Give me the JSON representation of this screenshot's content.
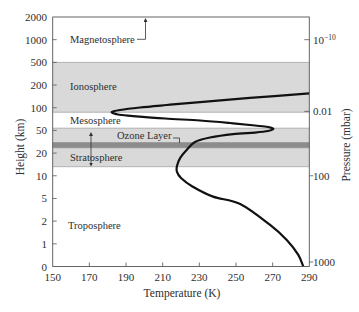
{
  "chart_data": {
    "type": "line",
    "title": "",
    "xlabel": "Temperature (K)",
    "ylabel": "Height (km)",
    "y2label": "Pressure (mbar)",
    "xlim": [
      150,
      290
    ],
    "x_ticks": [
      150,
      170,
      190,
      210,
      230,
      250,
      270,
      290
    ],
    "ylim": [
      0,
      2000
    ],
    "y_scale": "non-uniform (tick labels equally spaced)",
    "y_ticks": [
      0,
      1,
      2,
      5,
      10,
      20,
      50,
      100,
      200,
      500,
      1000,
      2000
    ],
    "y2_ticks": [
      {
        "base": "10",
        "exp": "-10",
        "at_height_km": 1000
      },
      {
        "base": "0.01",
        "exp": "",
        "at_height_km": 92
      },
      {
        "base": "100",
        "exp": "",
        "at_height_km": 10
      },
      {
        "base": "1000",
        "exp": "",
        "at_height_km": 0.2
      }
    ],
    "grid": false,
    "legend": null,
    "series": [
      {
        "name": "Temperature profile",
        "points": [
          {
            "T": 290.0,
            "h": 163
          },
          {
            "T": 257.6,
            "h": 143
          },
          {
            "T": 230.4,
            "h": 125
          },
          {
            "T": 212.2,
            "h": 112
          },
          {
            "T": 197.6,
            "h": 101
          },
          {
            "T": 186.7,
            "h": 95
          },
          {
            "T": 182.2,
            "h": 90.5
          },
          {
            "T": 185.6,
            "h": 85
          },
          {
            "T": 193.8,
            "h": 81.7
          },
          {
            "T": 211.3,
            "h": 76.2
          },
          {
            "T": 230.4,
            "h": 71.8
          },
          {
            "T": 246.7,
            "h": 66.3
          },
          {
            "T": 260.4,
            "h": 60.8
          },
          {
            "T": 267.5,
            "h": 57.5
          },
          {
            "T": 270.4,
            "h": 53.5
          },
          {
            "T": 267.5,
            "h": 49.2
          },
          {
            "T": 260.4,
            "h": 47.2
          },
          {
            "T": 248.4,
            "h": 45.2
          },
          {
            "T": 235.8,
            "h": 40.6
          },
          {
            "T": 227.6,
            "h": 34.7
          },
          {
            "T": 223.1,
            "h": 24.1
          },
          {
            "T": 219.5,
            "h": 17.8
          },
          {
            "T": 217.8,
            "h": 14.3
          },
          {
            "T": 217.8,
            "h": 11.7
          },
          {
            "T": 220.0,
            "h": 9.5
          },
          {
            "T": 226.0,
            "h": 7.7
          },
          {
            "T": 237.5,
            "h": 5.4
          },
          {
            "T": 252.3,
            "h": 4.26
          },
          {
            "T": 268.6,
            "h": 1.83
          },
          {
            "T": 277.7,
            "h": 1.17
          },
          {
            "T": 284.0,
            "h": 0.51
          },
          {
            "T": 286.7,
            "h": 0
          }
        ]
      }
    ],
    "layers": [
      {
        "name": "Magnetosphere",
        "range_km": [
          500,
          2000
        ],
        "shaded": false
      },
      {
        "name": "Ionosphere",
        "range_km": [
          90,
          500
        ],
        "shaded": true
      },
      {
        "name": "Mesosphere",
        "range_km": [
          55,
          90
        ],
        "shaded": false
      },
      {
        "name": "Ozone Layer",
        "range_km": [
          27,
          34
        ],
        "shaded": true,
        "dark": true
      },
      {
        "name": "Stratosphere",
        "range_km": [
          14,
          55
        ],
        "shaded": true
      },
      {
        "name": "Troposphere",
        "range_km": [
          0,
          14
        ],
        "shaded": false
      }
    ]
  },
  "colors": {
    "band": "#d9d9d9",
    "ozone": "#8c8c8c",
    "curve": "#111111",
    "text": "#2e2e2e",
    "axis": "#555555"
  }
}
